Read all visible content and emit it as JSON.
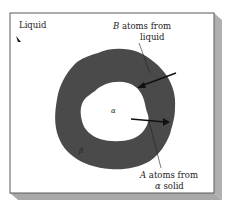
{
  "diagram": {
    "type": "phase-growth-schematic",
    "regions": {
      "outer": "Liquid",
      "ring": "β",
      "core": "α"
    },
    "annotations": {
      "top": {
        "line1_italic": "B",
        "line1_rest": " atoms from",
        "line2": "liquid"
      },
      "bottom": {
        "line1_italic": "A",
        "line1_rest": " atoms from",
        "line2_greek": "α",
        "line2_rest": " solid"
      }
    },
    "colors": {
      "background": "#ffffff",
      "frame": "#555555",
      "shadow": "#b3b3b3",
      "ring_fill": "#4a4a4a",
      "arrow": "#111111",
      "text": "#222222"
    }
  }
}
